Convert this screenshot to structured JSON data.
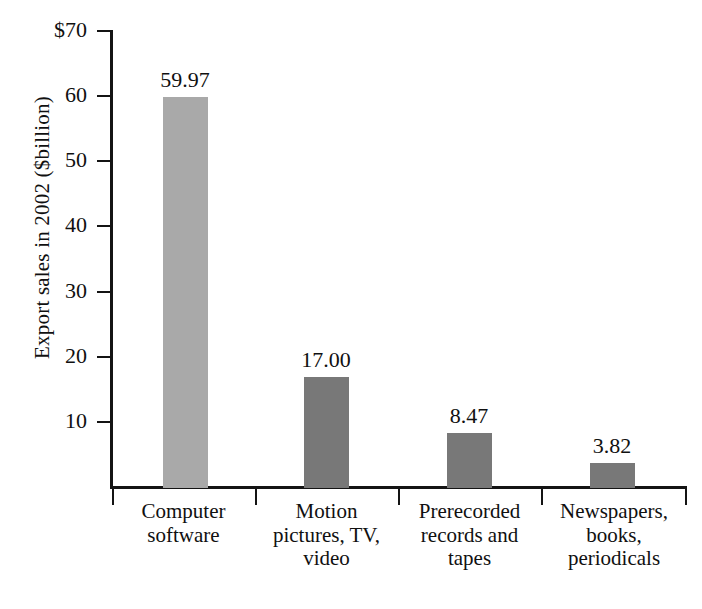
{
  "chart_data": {
    "type": "bar",
    "title": "",
    "subtitle": "",
    "xlabel": "",
    "ylabel": "Export sales in 2002 ($billion)",
    "categories": [
      "Computer software",
      "Motion pictures, TV, video",
      "Prerecorded records and tapes",
      "Newspapers, books, periodicals"
    ],
    "category_lines": [
      [
        "Computer",
        "software"
      ],
      [
        "Motion",
        "pictures, TV,",
        "video"
      ],
      [
        "Prerecorded",
        "records and",
        "tapes"
      ],
      [
        "Newspapers,",
        "books,",
        "periodicals"
      ]
    ],
    "values": [
      59.97,
      17.0,
      8.47,
      3.82
    ],
    "value_labels": [
      "59.97",
      "17.00",
      "8.47",
      "3.82"
    ],
    "bar_colors": [
      "#a9a9a9",
      "#787878",
      "#787878",
      "#787878"
    ],
    "ylim": [
      0,
      70
    ],
    "yticks": [
      10,
      20,
      30,
      40,
      50,
      60,
      70
    ],
    "ytick_labels": [
      "10",
      "20",
      "30",
      "40",
      "50",
      "60",
      "$70"
    ],
    "grid": false,
    "legend": false,
    "axis_color": "#141414"
  }
}
